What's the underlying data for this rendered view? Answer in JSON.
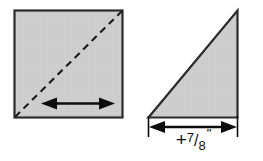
{
  "figure": {
    "background_color": "#ffffff",
    "fill_color": "#cccccc",
    "stroke_color": "#1a1a1a",
    "shapes": [
      {
        "name": "square",
        "type": "square",
        "x": 14,
        "y": 10,
        "width": 109,
        "height": 108,
        "fill": "#cccccc",
        "stroke": "#1a1a1a",
        "annotations": [
          {
            "name": "diagonal-fold-line",
            "type": "dashed-line",
            "from": [
              14,
              118
            ],
            "to": [
              123,
              10
            ],
            "style": "dashed"
          },
          {
            "name": "width-arrow",
            "type": "double-headed-arrow",
            "from": [
              43,
              103
            ],
            "to": [
              113,
              103
            ]
          }
        ]
      },
      {
        "name": "triangle",
        "type": "right-triangle",
        "vertices": [
          [
            148,
            118
          ],
          [
            238,
            118
          ],
          [
            238,
            10
          ]
        ],
        "fill": "#cccccc",
        "stroke": "#1a1a1a",
        "annotations": [
          {
            "name": "base-dimension",
            "type": "dimension-line",
            "from": [
              148,
              127
            ],
            "to": [
              238,
              127
            ],
            "extension_lines": [
              {
                "x": 148,
                "y1": 116,
                "y2": 136
              },
              {
                "x": 238,
                "y1": 116,
                "y2": 136
              }
            ]
          }
        ]
      }
    ]
  },
  "labels": {
    "base_dimension": {
      "full_text": "+7/8\"",
      "plus": "+",
      "numerator": "7",
      "slash": "/",
      "denominator": "8",
      "unit": "\""
    }
  }
}
